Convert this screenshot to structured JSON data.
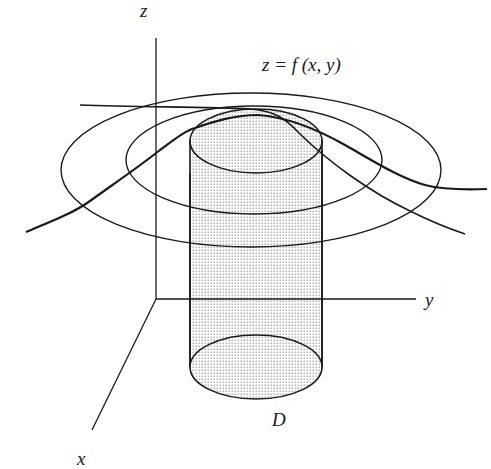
{
  "figure": {
    "type": "3d-surface-region-diagram",
    "labels": {
      "z_axis": "z",
      "y_axis": "y",
      "x_axis": "x",
      "region": "D",
      "surface_equation": "z = f (x, y)"
    },
    "colors": {
      "ink": "#1a1a1a",
      "background": "#ffffff",
      "stipple": "#8a8a8a"
    },
    "elements": [
      "z-axis",
      "y-axis",
      "x-axis",
      "outer-level-ellipse",
      "inner-level-ellipse",
      "surface-curve-front",
      "surface-curve-back",
      "cylinder-over-D",
      "region-D-ellipse"
    ]
  }
}
